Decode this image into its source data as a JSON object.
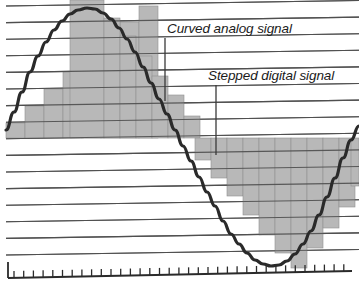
{
  "figure": {
    "type": "diagram",
    "width": 359,
    "height": 282,
    "background_color": "#ffffff"
  },
  "colors": {
    "gridline": "#4f4f4f",
    "curve": "#2a2a2a",
    "step_fill": "#b8b8b8",
    "step_edge": "#8f8f8f",
    "axis": "#2a2a2a",
    "leader_line": "#3a3a3a",
    "text": "#1b1b1b"
  },
  "annotations": [
    {
      "id": "curved-analog-signal",
      "label": "Curved analog signal",
      "text_x": 167,
      "text_y": 33,
      "leader": {
        "x1": 165,
        "y1": 38,
        "x2": 165,
        "y2": 101
      }
    },
    {
      "id": "stepped-digital-signal",
      "label": "Stepped digital signal",
      "text_x": 208,
      "text_y": 80,
      "leader": {
        "x1": 216,
        "y1": 85,
        "x2": 216,
        "y2": 155
      }
    }
  ],
  "grid": {
    "line_count": 16,
    "left_x": 6,
    "right_x": 359,
    "first_left_y": 6,
    "spacing": 16.6,
    "tilt_rise": -5.5,
    "gridlines_on": true
  },
  "axis": {
    "baseline": {
      "x1": 8,
      "y1": 278,
      "x2": 352,
      "y2": 271
    },
    "left_cap": {
      "x": 8,
      "y_top": 262,
      "y_bottom": 278
    },
    "tick_count": 35,
    "tick_length": 7,
    "tick_start_x": 14,
    "tick_spacing": 9.7
  },
  "chart_data": {
    "type": "line",
    "xlabel": "",
    "ylabel": "",
    "grid": true,
    "legend_position": "inline-annotations",
    "analog_curve": {
      "name": "Curved analog signal",
      "description": "Smooth sine wave, one full cycle across the plot",
      "amplitude": 120,
      "midline_y": 138,
      "cycle_start_x": 6,
      "cycle_end_x": 359,
      "zero_crossing_x": 179,
      "peak_x": 87,
      "peak_y": 8,
      "trough_x": 271,
      "trough_y": 266,
      "points": [
        [
          6,
          130
        ],
        [
          14,
          112
        ],
        [
          22,
          92
        ],
        [
          30,
          72
        ],
        [
          38,
          56
        ],
        [
          46,
          42
        ],
        [
          54,
          30
        ],
        [
          62,
          21
        ],
        [
          70,
          14
        ],
        [
          78,
          10
        ],
        [
          87,
          8
        ],
        [
          95,
          9
        ],
        [
          103,
          13
        ],
        [
          111,
          19
        ],
        [
          119,
          28
        ],
        [
          127,
          39
        ],
        [
          135,
          52
        ],
        [
          143,
          67
        ],
        [
          151,
          83
        ],
        [
          159,
          99
        ],
        [
          167,
          114
        ],
        [
          175,
          130
        ],
        [
          183,
          146
        ],
        [
          191,
          161
        ],
        [
          199,
          177
        ],
        [
          207,
          192
        ],
        [
          215,
          206
        ],
        [
          223,
          221
        ],
        [
          231,
          234
        ],
        [
          239,
          244
        ],
        [
          247,
          253
        ],
        [
          255,
          260
        ],
        [
          263,
          264
        ],
        [
          271,
          266
        ],
        [
          279,
          265
        ],
        [
          287,
          261
        ],
        [
          295,
          254
        ],
        [
          303,
          244
        ],
        [
          311,
          231
        ],
        [
          319,
          215
        ],
        [
          327,
          197
        ],
        [
          335,
          178
        ],
        [
          343,
          158
        ],
        [
          351,
          140
        ],
        [
          359,
          126
        ]
      ]
    },
    "stepped_signal": {
      "name": "Stepped digital signal",
      "description": "Quantized staircase approximation of the sine wave; bars rise in discrete steps aligned to the horizontal gridlines",
      "step_width": 19,
      "baseline_y": 138,
      "upper_steps": [
        {
          "x": 6,
          "width": 19,
          "top_y": 123
        },
        {
          "x": 25,
          "width": 19,
          "top_y": 106
        },
        {
          "x": 44,
          "width": 19,
          "top_y": 89
        },
        {
          "x": 63,
          "width": 19,
          "top_y": 72
        },
        {
          "x": 82,
          "width": 19,
          "top_y": 56
        },
        {
          "x": 101,
          "width": 19,
          "top_y": 39
        },
        {
          "x": 120,
          "width": 19,
          "top_y": 22
        },
        {
          "x": 139,
          "width": 19,
          "top_y": 6
        },
        {
          "x": 70,
          "width": 34,
          "top_y": 0
        },
        {
          "x": 104,
          "width": 16,
          "top_y": 18
        },
        {
          "x": 120,
          "width": 16,
          "top_y": 36
        },
        {
          "x": 136,
          "width": 16,
          "top_y": 56
        },
        {
          "x": 152,
          "width": 16,
          "top_y": 76
        },
        {
          "x": 168,
          "width": 16,
          "top_y": 95
        },
        {
          "x": 184,
          "width": 16,
          "top_y": 116
        }
      ],
      "lower_steps": [
        {
          "x": 195,
          "width": 16,
          "bottom_y": 160
        },
        {
          "x": 211,
          "width": 16,
          "bottom_y": 178
        },
        {
          "x": 227,
          "width": 16,
          "bottom_y": 196
        },
        {
          "x": 243,
          "width": 16,
          "bottom_y": 215
        },
        {
          "x": 259,
          "width": 16,
          "bottom_y": 235
        },
        {
          "x": 275,
          "width": 16,
          "bottom_y": 253
        },
        {
          "x": 291,
          "width": 16,
          "bottom_y": 268
        },
        {
          "x": 307,
          "width": 16,
          "bottom_y": 248
        },
        {
          "x": 323,
          "width": 16,
          "bottom_y": 228
        },
        {
          "x": 339,
          "width": 16,
          "bottom_y": 207
        },
        {
          "x": 351,
          "width": 8,
          "bottom_y": 186
        }
      ]
    }
  }
}
